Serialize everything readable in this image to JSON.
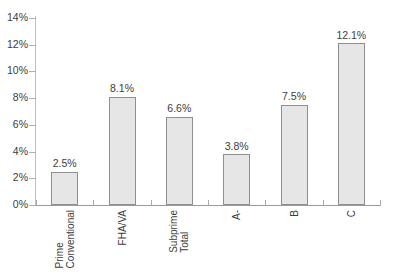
{
  "chart_data": {
    "type": "bar",
    "title": "",
    "xlabel": "",
    "ylabel": "",
    "ylim": [
      0,
      14
    ],
    "ytick_step": 2,
    "grid": false,
    "legend": false,
    "categories": [
      "Prime\nConventional",
      "FHA/VA",
      "Subprime\nTotal",
      "A-",
      "B",
      "C"
    ],
    "values": [
      2.5,
      8.1,
      6.6,
      3.8,
      7.5,
      12.1
    ],
    "data_labels": [
      "2.5%",
      "8.1%",
      "6.6%",
      "3.8%",
      "7.5%",
      "12.1%"
    ],
    "ytick_labels": [
      "0%",
      "2%",
      "4%",
      "6%",
      "8%",
      "10%",
      "12%",
      "14%"
    ],
    "ytick_values": [
      0,
      2,
      4,
      6,
      8,
      10,
      12,
      14
    ]
  },
  "style": {
    "bar_fill": "#e6e6e6",
    "bar_border": "#8f8f8f",
    "axis_color": "#9a9a9a",
    "tick_color": "#b0b0b0",
    "text_color": "#3d3d3d",
    "background": "#ffffff"
  },
  "title_sliver": {
    "text": ""
  }
}
